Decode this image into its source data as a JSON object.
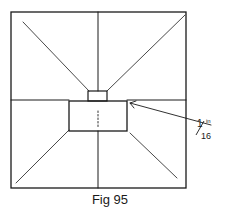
{
  "figure": {
    "caption": "Fig 95",
    "annotation": {
      "numerator": "1",
      "denominator": "16",
      "unit": "in"
    },
    "colors": {
      "line": "#1a1a1a",
      "background": "#ffffff"
    }
  }
}
